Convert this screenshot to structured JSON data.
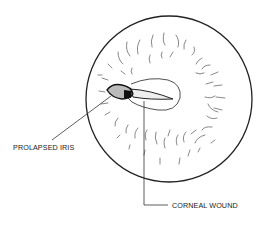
{
  "figure": {
    "labels": {
      "prolapsed_iris": "PROLAPSED IRIS",
      "corneal_wound": "CORNEAL WOUND"
    },
    "colors": {
      "ink": "#222222",
      "background": "#ffffff"
    }
  }
}
